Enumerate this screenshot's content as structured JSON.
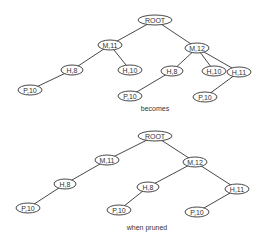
{
  "trees": [
    {
      "id": "original",
      "caption": "becomes",
      "caption_pos": [
        155,
        111
      ],
      "nodes": [
        {
          "id": "root",
          "label": "ROOT",
          "x": 155,
          "y": 20,
          "w": 34
        },
        {
          "id": "m11",
          "label": "M,11",
          "x": 110,
          "y": 45,
          "w": 24
        },
        {
          "id": "m12",
          "label": "M,12",
          "x": 197,
          "y": 48,
          "w": 24
        },
        {
          "id": "h8a",
          "label": "H,8",
          "x": 72,
          "y": 70,
          "w": 22
        },
        {
          "id": "h10a",
          "label": "H,10",
          "x": 130,
          "y": 70,
          "w": 24
        },
        {
          "id": "h8b",
          "label": "H,8",
          "x": 172,
          "y": 71,
          "w": 22
        },
        {
          "id": "h10b",
          "label": "H,10",
          "x": 214,
          "y": 71,
          "w": 24
        },
        {
          "id": "h11",
          "label": "H,11",
          "x": 239,
          "y": 72,
          "w": 24
        },
        {
          "id": "p10a",
          "label": "P,10",
          "x": 30,
          "y": 90,
          "w": 24
        },
        {
          "id": "p10b",
          "label": "P,10",
          "x": 130,
          "y": 96,
          "w": 24
        },
        {
          "id": "p10c",
          "label": "P,10",
          "x": 205,
          "y": 97,
          "w": 24
        }
      ],
      "edges": [
        [
          "root",
          "m11"
        ],
        [
          "root",
          "m12"
        ],
        [
          "m11",
          "h8a"
        ],
        [
          "m11",
          "h10a"
        ],
        [
          "m12",
          "h8b"
        ],
        [
          "m12",
          "h10b"
        ],
        [
          "m12",
          "h11"
        ],
        [
          "h8a",
          "p10a"
        ],
        [
          "h8b",
          "p10b"
        ],
        [
          "h11",
          "p10c"
        ]
      ]
    },
    {
      "id": "pruned",
      "caption": "when pruned",
      "caption_pos": [
        147,
        230
      ],
      "nodes": [
        {
          "id": "root",
          "label": "ROOT",
          "x": 155,
          "y": 136,
          "w": 34
        },
        {
          "id": "m11",
          "label": "M,11",
          "x": 107,
          "y": 160,
          "w": 24
        },
        {
          "id": "m12",
          "label": "M,12",
          "x": 195,
          "y": 162,
          "w": 24
        },
        {
          "id": "h8a",
          "label": "H,8",
          "x": 65,
          "y": 184,
          "w": 22
        },
        {
          "id": "h8b",
          "label": "H,8",
          "x": 148,
          "y": 187,
          "w": 22
        },
        {
          "id": "h11",
          "label": "H,11",
          "x": 237,
          "y": 189,
          "w": 24
        },
        {
          "id": "p10a",
          "label": "P,10",
          "x": 28,
          "y": 208,
          "w": 24
        },
        {
          "id": "p10b",
          "label": "P,10",
          "x": 119,
          "y": 210,
          "w": 24
        },
        {
          "id": "p10c",
          "label": "P,10",
          "x": 197,
          "y": 212,
          "w": 24
        }
      ],
      "edges": [
        [
          "root",
          "m11"
        ],
        [
          "root",
          "m12"
        ],
        [
          "m11",
          "h8a"
        ],
        [
          "m12",
          "h8b"
        ],
        [
          "m12",
          "h11"
        ],
        [
          "h8a",
          "p10a"
        ],
        [
          "h8b",
          "p10b"
        ],
        [
          "h11",
          "p10c"
        ]
      ]
    }
  ],
  "node_height": 10
}
